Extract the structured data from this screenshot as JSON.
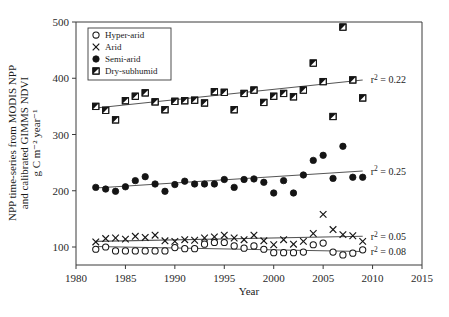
{
  "chart_data": {
    "type": "scatter",
    "title": "",
    "xlabel": "Year",
    "ylabel_lines": [
      "NPP time-series from MODIS NPP",
      "and calibrated GIMMS NDVI",
      "g C m⁻² year⁻¹"
    ],
    "xlim": [
      1980,
      2015
    ],
    "ylim": [
      60,
      500
    ],
    "xticks": [
      1980,
      1985,
      1990,
      1995,
      2000,
      2005,
      2010,
      2015
    ],
    "yticks": [
      100,
      200,
      300,
      400,
      500
    ],
    "grid": false,
    "legend_position": "top-left",
    "x": [
      1982,
      1983,
      1984,
      1985,
      1986,
      1987,
      1988,
      1989,
      1990,
      1991,
      1992,
      1993,
      1994,
      1995,
      1996,
      1997,
      1998,
      1999,
      2000,
      2001,
      2002,
      2003,
      2004,
      2005,
      2006,
      2007,
      2008,
      2009
    ],
    "series": [
      {
        "name": "Hyper-arid",
        "marker": "open-circle",
        "r2_label": "r² = 0.08",
        "r2_value": 0.08,
        "trend": {
          "y_start": 101,
          "y_end": 92
        },
        "values": [
          96,
          100,
          93,
          93,
          93,
          93,
          93,
          93,
          99,
          97,
          97,
          105,
          108,
          108,
          102,
          98,
          102,
          96,
          90,
          90,
          90,
          91,
          104,
          107,
          91,
          86,
          89,
          95
        ]
      },
      {
        "name": "Arid",
        "marker": "cross",
        "r2_label": "r² = 0.05",
        "r2_value": 0.05,
        "trend": {
          "y_start": 110,
          "y_end": 119
        },
        "values": [
          109,
          115,
          116,
          114,
          119,
          117,
          121,
          111,
          110,
          113,
          112,
          116,
          118,
          121,
          116,
          113,
          121,
          111,
          104,
          113,
          105,
          110,
          124,
          158,
          131,
          122,
          120,
          110
        ]
      },
      {
        "name": "Semi-arid",
        "marker": "filled-circle",
        "r2_label": "r² = 0.25",
        "r2_value": 0.25,
        "trend": {
          "y_start": 205,
          "y_end": 235
        },
        "values": [
          206,
          203,
          199,
          207,
          218,
          225,
          212,
          199,
          211,
          217,
          212,
          212,
          212,
          220,
          206,
          220,
          221,
          215,
          196,
          218,
          196,
          228,
          254,
          263,
          222,
          279,
          224,
          224
        ]
      },
      {
        "name": "Dry-subhumid",
        "marker": "split-square",
        "r2_label": "r² = 0.22",
        "r2_value": 0.22,
        "trend": {
          "y_start": 347,
          "y_end": 397
        },
        "values": [
          350,
          343,
          326,
          360,
          368,
          374,
          358,
          344,
          359,
          360,
          361,
          356,
          376,
          375,
          344,
          373,
          379,
          357,
          368,
          373,
          367,
          379,
          427,
          394,
          332,
          491,
          397,
          365
        ]
      }
    ]
  },
  "legend": {
    "entries": [
      {
        "label": "Hyper-arid",
        "marker": "open-circle"
      },
      {
        "label": "Arid",
        "marker": "cross"
      },
      {
        "label": "Semi-arid",
        "marker": "filled-circle"
      },
      {
        "label": "Dry-subhumid",
        "marker": "split-square"
      }
    ]
  },
  "colors": {
    "axis": "#3a3a3a",
    "marker": "#141414",
    "trend": "#555555",
    "text": "#1a1a1a",
    "background": "#ffffff"
  }
}
